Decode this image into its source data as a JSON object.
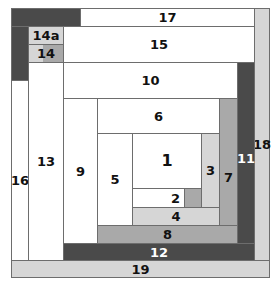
{
  "diagram": {
    "type": "log-cabin-block-layout",
    "blocks": [
      {
        "id": "17",
        "label": "17",
        "shade": "white"
      },
      {
        "id": "17-dark",
        "label": "",
        "shade": "dark"
      },
      {
        "id": "left-dark",
        "label": "",
        "shade": "dark"
      },
      {
        "id": "14a",
        "label": "14a",
        "shade": "light"
      },
      {
        "id": "14",
        "label": "14",
        "shade": "mid"
      },
      {
        "id": "15",
        "label": "15",
        "shade": "white"
      },
      {
        "id": "10",
        "label": "10",
        "shade": "white"
      },
      {
        "id": "16",
        "label": "16",
        "shade": "white"
      },
      {
        "id": "13",
        "label": "13",
        "shade": "white"
      },
      {
        "id": "9",
        "label": "9",
        "shade": "white"
      },
      {
        "id": "6",
        "label": "6",
        "shade": "white"
      },
      {
        "id": "5",
        "label": "5",
        "shade": "white"
      },
      {
        "id": "1",
        "label": "1",
        "shade": "white"
      },
      {
        "id": "2",
        "label": "2",
        "shade": "white"
      },
      {
        "id": "2-gray",
        "label": "",
        "shade": "mid"
      },
      {
        "id": "3",
        "label": "3",
        "shade": "light"
      },
      {
        "id": "4",
        "label": "4",
        "shade": "light"
      },
      {
        "id": "7",
        "label": "7",
        "shade": "mid"
      },
      {
        "id": "8",
        "label": "8",
        "shade": "mid"
      },
      {
        "id": "11",
        "label": "11",
        "shade": "dark"
      },
      {
        "id": "12",
        "label": "12",
        "shade": "dark"
      },
      {
        "id": "18",
        "label": "18",
        "shade": "light"
      },
      {
        "id": "19",
        "label": "19",
        "shade": "light"
      }
    ],
    "colors": {
      "white": "#ffffff",
      "light": "#d6d6d6",
      "mid": "#a9a9a9",
      "dark": "#4a4a4a",
      "border": "#6d6d6d"
    }
  }
}
